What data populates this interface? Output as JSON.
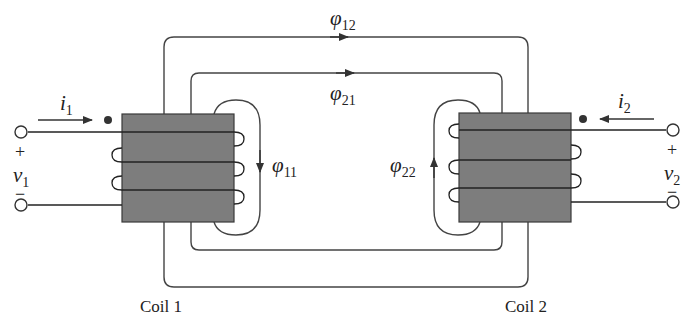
{
  "colors": {
    "line": "#333333",
    "core_fill": "#7d7d7d",
    "core_stroke": "#3a3a3a",
    "background": "#ffffff"
  },
  "coils": [
    {
      "id": "coil1",
      "label": "Coil 1",
      "current": {
        "symbol": "i",
        "sub": "1",
        "direction": "right"
      },
      "voltage": {
        "symbol": "v",
        "sub": "1",
        "plus": "+",
        "minus": "−"
      },
      "self_flux": {
        "symbol": "φ",
        "sub": "11",
        "direction": "down"
      }
    },
    {
      "id": "coil2",
      "label": "Coil 2",
      "current": {
        "symbol": "i",
        "sub": "2",
        "direction": "left"
      },
      "voltage": {
        "symbol": "v",
        "sub": "2",
        "plus": "+",
        "minus": "−"
      },
      "self_flux": {
        "symbol": "φ",
        "sub": "22",
        "direction": "up"
      }
    }
  ],
  "mutual_flux": [
    {
      "symbol": "φ",
      "sub": "12",
      "direction": "right",
      "path": "outer"
    },
    {
      "symbol": "φ",
      "sub": "21",
      "direction": "right",
      "path": "inner"
    }
  ]
}
